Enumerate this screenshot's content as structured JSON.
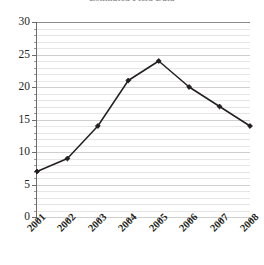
{
  "chart_data": {
    "type": "line",
    "title": "Estimated Field Data",
    "title_note": "title is cropped by the top edge of the screenshot and only a sliver of the glyphs is visible",
    "xlabel": "",
    "ylabel": "",
    "categories": [
      "2001",
      "2002",
      "2003",
      "2004",
      "2005",
      "2006",
      "2007",
      "2008"
    ],
    "values": [
      7,
      9,
      14,
      21,
      24,
      20,
      17,
      14
    ],
    "series": [
      {
        "name": "",
        "values": [
          7,
          9,
          14,
          21,
          24,
          20,
          17,
          14
        ]
      }
    ],
    "ylim": [
      0,
      30
    ],
    "y_major_ticks": [
      0,
      5,
      10,
      15,
      20,
      25,
      30
    ],
    "y_minor_tick_step": 1,
    "grid": true,
    "grid_axis": "y",
    "legend": false,
    "legend_position": "none",
    "marker": "diamond",
    "line_color": "#231f20",
    "marker_color": "#231f20",
    "grid_color": "#e6e6e6",
    "grid_major_color": "#cfcfcf",
    "axis_color": "#6b6b6b",
    "background": "#ffffff",
    "x_tick_label_rotation": -45,
    "points": [
      {
        "x": "2001",
        "y": 7
      },
      {
        "x": "2002",
        "y": 9
      },
      {
        "x": "2003",
        "y": 14
      },
      {
        "x": "2004",
        "y": 21
      },
      {
        "x": "2005",
        "y": 24
      },
      {
        "x": "2006",
        "y": 20
      },
      {
        "x": "2007",
        "y": 17
      },
      {
        "x": "2008",
        "y": 14
      }
    ]
  }
}
